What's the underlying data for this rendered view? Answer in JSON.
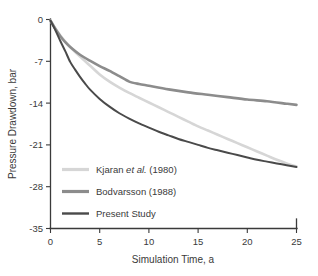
{
  "chart_data": {
    "type": "line",
    "title": "",
    "xlabel": "Simulation Time, a",
    "ylabel": "Pressure Drawdown, bar",
    "xlim": [
      0,
      25
    ],
    "ylim": [
      -35,
      0
    ],
    "xticks": [
      "0",
      "5",
      "10",
      "15",
      "20",
      "25"
    ],
    "yticks": [
      "0",
      "-7",
      "-14",
      "-21",
      "-28",
      "-35"
    ],
    "grid": false,
    "legend_position": "lower left inside",
    "series": [
      {
        "name": "Kjaran et al. (1980)",
        "name_prefix": "Kjaran ",
        "name_italic": "et al.",
        "name_suffix": " (1980)",
        "color": "#d6d6d6",
        "x": [
          0,
          0.5,
          1,
          1.5,
          2,
          3,
          4,
          5,
          6,
          7,
          8,
          9,
          10,
          11,
          12,
          13,
          14,
          15,
          16,
          17,
          18,
          19,
          20,
          21,
          22,
          23,
          24,
          25
        ],
        "y": [
          -0.2,
          -1.5,
          -2.7,
          -3.7,
          -4.6,
          -6.2,
          -7.7,
          -9.2,
          -10.4,
          -11.4,
          -12.3,
          -13.1,
          -13.9,
          -14.7,
          -15.5,
          -16.3,
          -17.1,
          -17.9,
          -18.6,
          -19.3,
          -20.0,
          -20.7,
          -21.4,
          -22.1,
          -22.8,
          -23.5,
          -24.1,
          -24.6
        ]
      },
      {
        "name": "Bodvarsson (1988)",
        "color": "#8c8c8c",
        "x": [
          0,
          0.5,
          1,
          1.5,
          2,
          3,
          4,
          5,
          6,
          7,
          8,
          9,
          10,
          12,
          14,
          16,
          18,
          20,
          22,
          24,
          25
        ],
        "y": [
          -0.2,
          -1.6,
          -2.8,
          -3.8,
          -4.6,
          -5.9,
          -6.9,
          -7.8,
          -8.6,
          -9.5,
          -10.4,
          -10.8,
          -11.1,
          -11.7,
          -12.2,
          -12.6,
          -13.0,
          -13.4,
          -13.7,
          -14.1,
          -14.3
        ]
      },
      {
        "name": "Present Study",
        "color": "#4a4a4a",
        "x": [
          0,
          0.5,
          1,
          1.5,
          2,
          2.5,
          3,
          3.5,
          4,
          5,
          6,
          7,
          8,
          9,
          10,
          11,
          12,
          13,
          14,
          15,
          16,
          17,
          18,
          19,
          20,
          21,
          22,
          23,
          24,
          25
        ],
        "y": [
          -0.2,
          -1.8,
          -3.6,
          -5.3,
          -7.1,
          -8.4,
          -9.6,
          -10.7,
          -11.7,
          -13.3,
          -14.6,
          -15.7,
          -16.6,
          -17.4,
          -18.1,
          -18.8,
          -19.4,
          -20.0,
          -20.5,
          -21.0,
          -21.5,
          -21.9,
          -22.3,
          -22.7,
          -23.1,
          -23.5,
          -23.8,
          -24.1,
          -24.4,
          -24.7
        ]
      }
    ]
  },
  "legend": {
    "items": [
      {
        "label": "Kjaran et al. (1980)",
        "color": "#d6d6d6"
      },
      {
        "label": "Bodvarsson (1988)",
        "color": "#8c8c8c"
      },
      {
        "label": "Present Study",
        "color": "#4a4a4a"
      }
    ]
  },
  "axes": {
    "x_title": "Simulation Time, a",
    "y_title": "Pressure Drawdown, bar",
    "x_tick_labels": [
      "0",
      "5",
      "10",
      "15",
      "20",
      "25"
    ],
    "y_tick_labels": [
      "0",
      "-7",
      "-14",
      "-21",
      "-28",
      "-35"
    ]
  }
}
